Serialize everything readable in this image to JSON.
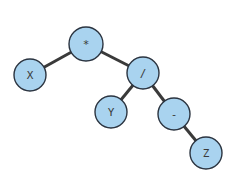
{
  "diagram": {
    "type": "expression-tree",
    "nodes": [
      {
        "id": "times",
        "label": "*",
        "x": 86,
        "y": 44,
        "r": 17
      },
      {
        "id": "x",
        "label": "X",
        "x": 30,
        "y": 75,
        "r": 16
      },
      {
        "id": "div",
        "label": "/",
        "x": 143,
        "y": 73,
        "r": 16
      },
      {
        "id": "y",
        "label": "Y",
        "x": 111,
        "y": 112,
        "r": 16
      },
      {
        "id": "minus",
        "label": "-",
        "x": 174,
        "y": 114,
        "r": 16
      },
      {
        "id": "z",
        "label": "Z",
        "x": 206,
        "y": 153,
        "r": 16
      }
    ],
    "edges": [
      {
        "from": "times",
        "to": "x"
      },
      {
        "from": "times",
        "to": "div"
      },
      {
        "from": "div",
        "to": "y"
      },
      {
        "from": "div",
        "to": "minus"
      },
      {
        "from": "minus",
        "to": "z"
      }
    ],
    "colors": {
      "node_fill": "#a9d3ef",
      "node_stroke": "#2b3440",
      "edge": "#3a3a3a"
    }
  }
}
